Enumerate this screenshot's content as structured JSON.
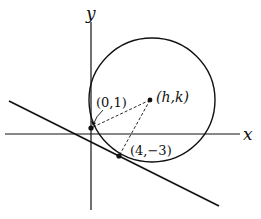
{
  "diagram": {
    "axes": {
      "x_label": "x",
      "y_label": "y"
    },
    "points": {
      "center_label": "(h,k)",
      "p1_label": "(0,1)",
      "p2_label": "(4,−3)"
    },
    "colors": {
      "ink": "#111111",
      "background": "#ffffff"
    }
  }
}
